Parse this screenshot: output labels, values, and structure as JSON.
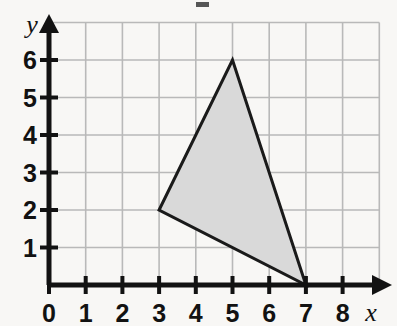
{
  "figure": {
    "name": "coordinate-grid-triangle",
    "background_color": "#f8f7f5",
    "grid_color": "#b9b9b9",
    "axis_color": "#121212",
    "shape_fill": "#d9d9d9",
    "shape_stroke": "#1a1a1a"
  },
  "axes": {
    "x": {
      "label": "x",
      "ticks": [
        "0",
        "1",
        "2",
        "3",
        "4",
        "5",
        "6",
        "7",
        "8"
      ],
      "min": 0,
      "max": 8
    },
    "y": {
      "label": "y",
      "ticks": [
        "0",
        "1",
        "2",
        "3",
        "4",
        "5",
        "6"
      ],
      "min": 0,
      "max": 6
    },
    "origin_label": "0"
  },
  "chart_data": {
    "type": "scatter",
    "title": "",
    "xlabel": "x",
    "ylabel": "y",
    "xlim": [
      0,
      8.9
    ],
    "ylim": [
      0,
      7
    ],
    "grid": true,
    "legend": "none",
    "x_ticks": [
      0,
      1,
      2,
      3,
      4,
      5,
      6,
      7,
      8
    ],
    "y_ticks": [
      0,
      1,
      2,
      3,
      4,
      5,
      6
    ],
    "x_tick_labels": [
      "0",
      "1",
      "2",
      "3",
      "4",
      "5",
      "6",
      "7",
      "8"
    ],
    "y_tick_labels": [
      "0",
      "1",
      "2",
      "3",
      "4",
      "5",
      "6"
    ],
    "series": [
      {
        "name": "shaded-triangle",
        "type": "polygon",
        "fill": "#d9d9d9",
        "stroke": "#1a1a1a",
        "points": [
          {
            "x": 3,
            "y": 2
          },
          {
            "x": 5,
            "y": 6
          },
          {
            "x": 7,
            "y": 0
          }
        ]
      }
    ]
  }
}
